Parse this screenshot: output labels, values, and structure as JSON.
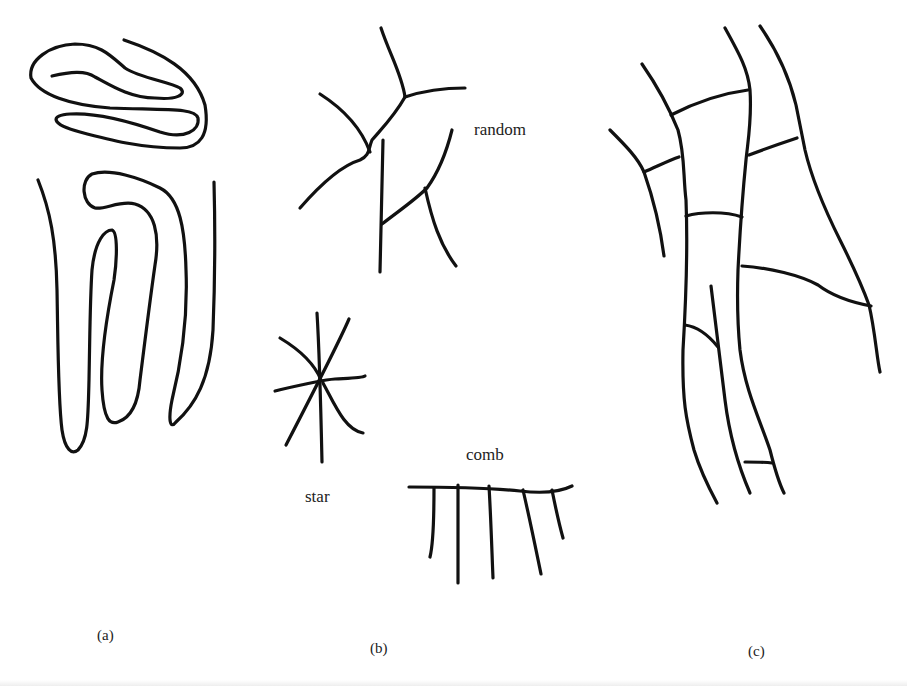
{
  "figure": {
    "panels": [
      {
        "id": "a",
        "label": "(a)",
        "description": "folded / meandering single filaments"
      },
      {
        "id": "b",
        "label": "(b)",
        "description": "branching patterns",
        "sub_labels": {
          "random": "random",
          "star": "star",
          "comb": "comb"
        }
      },
      {
        "id": "c",
        "label": "(c)",
        "description": "network of long filaments joined by cross-links"
      }
    ],
    "colors": {
      "ink": "#111111",
      "background": "#ffffff",
      "text": "#222222"
    }
  }
}
